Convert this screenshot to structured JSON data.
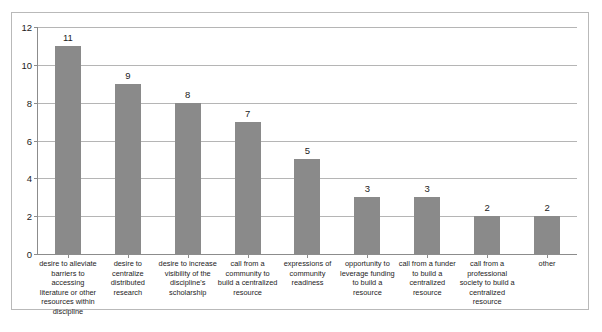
{
  "chart_data": {
    "type": "bar",
    "title": "",
    "xlabel": "",
    "ylabel": "",
    "ylim": [
      0,
      12
    ],
    "yticks": [
      0,
      2,
      4,
      6,
      8,
      10,
      12
    ],
    "grid": true,
    "legend": false,
    "bar_color": "#8a8a8a",
    "categories": [
      "desire to alleviate barriers to accessing literature or other resources within discipline",
      "desire to centralize distributed research",
      "desire to increase visibility of the discipline's scholarship",
      "call from a community to build a centralized resource",
      "expressions of community readiness",
      "opportunity to leverage funding to build a resource",
      "call from a funder to build  a centralized resource",
      "call from a professional society to build a centralized resource",
      "other"
    ],
    "values": [
      11,
      9,
      8,
      7,
      5,
      3,
      3,
      2,
      2
    ],
    "value_labels": [
      "11",
      "9",
      "8",
      "7",
      "5",
      "3",
      "3",
      "2",
      "2"
    ],
    "ytick_labels": [
      "0",
      "2",
      "4",
      "6",
      "8",
      "10",
      "12"
    ]
  }
}
